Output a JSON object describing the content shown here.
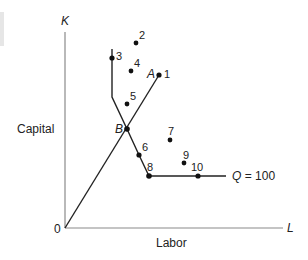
{
  "diagram": {
    "axes": {
      "y_symbol": "K",
      "x_symbol": "L",
      "y_label": "Capital",
      "x_label": "Labor",
      "origin_label": "0"
    },
    "isoquant_label": "Q = 100",
    "isoquant_q": "Q",
    "isoquant_value": "= 100",
    "ray_labels": {
      "a": "A",
      "b": "B"
    },
    "points": [
      {
        "id": "1",
        "label": "1"
      },
      {
        "id": "2",
        "label": "2"
      },
      {
        "id": "3",
        "label": "3"
      },
      {
        "id": "4",
        "label": "4"
      },
      {
        "id": "5",
        "label": "5"
      },
      {
        "id": "6",
        "label": "6"
      },
      {
        "id": "7",
        "label": "7"
      },
      {
        "id": "8",
        "label": "8"
      },
      {
        "id": "9",
        "label": "9"
      },
      {
        "id": "10",
        "label": "10"
      }
    ],
    "colors": {
      "axis": "#8a8a8a",
      "curve": "#222222",
      "text": "#222222"
    }
  }
}
